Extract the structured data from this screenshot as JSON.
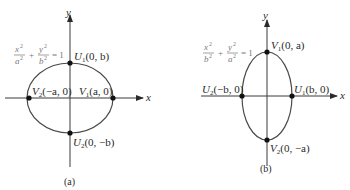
{
  "diagrams": [
    {
      "caption": "(a)",
      "x_axis_label": "x",
      "y_axis_label": "y",
      "equation": {
        "t1_num": "x",
        "t1_den": "a",
        "t2_num": "y",
        "t2_den": "b",
        "rhs": "= 1"
      },
      "points": [
        {
          "name": "U",
          "sub": "1",
          "coords": "(0, b)"
        },
        {
          "name": "U",
          "sub": "2",
          "coords": "(0, −b)"
        },
        {
          "name": "V",
          "sub": "1",
          "coords": "(a, 0)"
        },
        {
          "name": "V",
          "sub": "2",
          "coords": "(−a, 0)"
        }
      ]
    },
    {
      "caption": "(b)",
      "x_axis_label": "x",
      "y_axis_label": "y",
      "equation": {
        "t1_num": "x",
        "t1_den": "b",
        "t2_num": "y",
        "t2_den": "a",
        "rhs": "= 1"
      },
      "points": [
        {
          "name": "V",
          "sub": "1",
          "coords": "(0, a)"
        },
        {
          "name": "V",
          "sub": "2",
          "coords": "(0, −a)"
        },
        {
          "name": "U",
          "sub": "1",
          "coords": "(b, 0)"
        },
        {
          "name": "U",
          "sub": "2",
          "coords": "(−b, 0)"
        }
      ]
    }
  ],
  "colors": {
    "ink": "#2a2a2a",
    "equation": "#7a7a7a"
  }
}
